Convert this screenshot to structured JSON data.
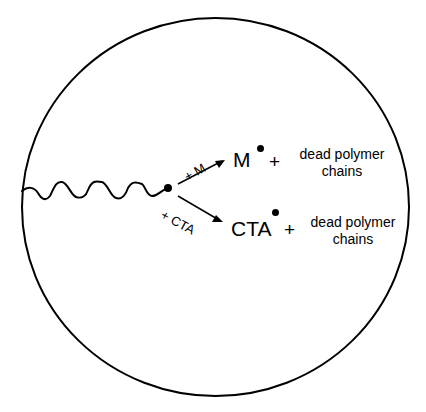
{
  "diagram": {
    "type": "reaction-scheme",
    "colors": {
      "stroke": "#000000",
      "background": "#ffffff"
    },
    "branches": [
      {
        "reagent_label": "+ M",
        "product_label": "M",
        "product_radical": "•",
        "plus": "+",
        "byproduct_line1": "dead polymer",
        "byproduct_line2": "chains"
      },
      {
        "reagent_label": "+ CTA",
        "product_label": "CTA",
        "product_radical": "•",
        "plus": "+",
        "byproduct_line1": "dead polymer",
        "byproduct_line2": "chains"
      }
    ]
  }
}
